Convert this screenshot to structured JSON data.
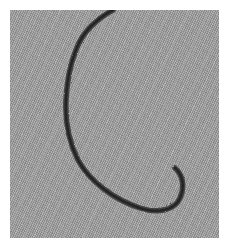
{
  "image": {
    "subject": "dark twisted thread lying on grey woven fabric",
    "description": "A single dark grey/black twisted thread forms a C / hook shape on a light grey twill fabric with diagonal weave lines.",
    "colors": {
      "fabric": "#a9a9a9",
      "thread": "#2b2b2b",
      "background": "#ffffff"
    }
  }
}
